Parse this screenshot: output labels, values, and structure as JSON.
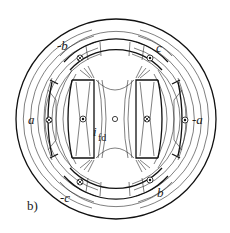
{
  "figure": {
    "panel_label": "b)",
    "stator_phase_labels": [
      {
        "id": "a",
        "text": "a",
        "x": 28,
        "y": 122
      },
      {
        "id": "neg-a",
        "text": "-a",
        "x": 195,
        "y": 122
      },
      {
        "id": "neg-b",
        "text": "-b",
        "x": 58,
        "y": 50
      },
      {
        "id": "c",
        "text": "c",
        "x": 157,
        "y": 52
      },
      {
        "id": "neg-c",
        "text": "-c",
        "x": 62,
        "y": 202
      },
      {
        "id": "b",
        "text": "b",
        "x": 158,
        "y": 196
      }
    ],
    "field_current_label": {
      "main": "i",
      "sub": "fd"
    },
    "conductor_symbols": [
      {
        "id": "a-slot",
        "type": "cross",
        "x": 49,
        "y": 120
      },
      {
        "id": "neg-a-slot",
        "type": "dot",
        "x": 185,
        "y": 120
      },
      {
        "id": "neg-b-slot",
        "type": "cross",
        "x": 80,
        "y": 58
      },
      {
        "id": "c-slot",
        "type": "dot",
        "x": 150,
        "y": 58
      },
      {
        "id": "neg-c-slot",
        "type": "cross",
        "x": 80,
        "y": 182
      },
      {
        "id": "b-slot",
        "type": "dot",
        "x": 150,
        "y": 180
      },
      {
        "id": "rotor-left",
        "type": "dot",
        "x": 82,
        "y": 119
      },
      {
        "id": "rotor-right",
        "type": "cross",
        "x": 147,
        "y": 119
      },
      {
        "id": "shaft",
        "type": "circle",
        "x": 115,
        "y": 119
      }
    ],
    "colors": {
      "line": "#1a1a1a",
      "background": "#ffffff"
    }
  }
}
